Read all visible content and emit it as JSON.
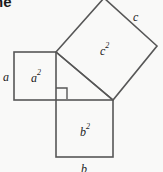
{
  "figure": {
    "title_fragment": "ne",
    "background_color": "#f9f9f8",
    "stroke_color": "#575757",
    "text_color": "#1c1c1c",
    "stroke_width": 1.6,
    "labels": {
      "side_a": "a",
      "side_b": "b",
      "side_c": "c",
      "area_a": {
        "base": "a",
        "exp": "2"
      },
      "area_b": {
        "base": "b",
        "exp": "2"
      },
      "area_c": {
        "base": "c",
        "exp": "2"
      }
    },
    "geometry": {
      "triangle": {
        "vertex_top_left": [
          56,
          52
        ],
        "vertex_right_angle": [
          56,
          100
        ],
        "vertex_bottom_right": [
          113,
          100
        ]
      },
      "square_a": {
        "x": 14,
        "y": 52,
        "side": 42
      },
      "square_b": {
        "x": 56,
        "y": 100,
        "side": 57
      },
      "square_c": {
        "points": "56,52 104,-2 157,46 113,100"
      },
      "right_angle_marker": {
        "x": 56,
        "y": 88,
        "size": 11
      }
    }
  }
}
